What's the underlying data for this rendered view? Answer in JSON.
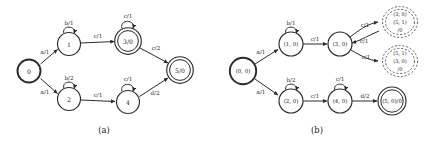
{
  "figure": {
    "background_color": "#ffffff",
    "stroke_color": "#2b2b2b",
    "cloud_stroke_color": "#4a4a4a",
    "panels": [
      {
        "id": "panel-a",
        "caption": "(a)",
        "states": [
          {
            "id": "s0",
            "label": "0",
            "type": "start",
            "cx": 29,
            "cy": 71
          },
          {
            "id": "s1",
            "label": "1",
            "type": "normal",
            "cx": 69,
            "cy": 44
          },
          {
            "id": "s2",
            "label": "2",
            "type": "normal",
            "cx": 69,
            "cy": 99
          },
          {
            "id": "s3",
            "label": "3/0",
            "type": "accept",
            "cx": 128,
            "cy": 41
          },
          {
            "id": "s4",
            "label": "4",
            "type": "normal",
            "cx": 128,
            "cy": 102
          },
          {
            "id": "s5",
            "label": "5/0",
            "type": "accept",
            "cx": 180,
            "cy": 70
          }
        ],
        "transitions": [
          {
            "from": "s0",
            "to": "s1",
            "label": "a/1"
          },
          {
            "from": "s0",
            "to": "s2",
            "label": "a/1"
          },
          {
            "from": "s1",
            "to": "s1",
            "label": "b/1",
            "self_loop": true
          },
          {
            "from": "s2",
            "to": "s2",
            "label": "b/2",
            "self_loop": true
          },
          {
            "from": "s1",
            "to": "s3",
            "label": "c/1"
          },
          {
            "from": "s2",
            "to": "s4",
            "label": "c/1"
          },
          {
            "from": "s3",
            "to": "s3",
            "label": "c/1",
            "self_loop": true
          },
          {
            "from": "s4",
            "to": "s4",
            "label": "c/1",
            "self_loop": true
          },
          {
            "from": "s3",
            "to": "s5",
            "label": "c/2"
          },
          {
            "from": "s4",
            "to": "s5",
            "label": "d/2"
          }
        ]
      },
      {
        "id": "panel-b",
        "caption": "(b)",
        "states": [
          {
            "id": "t0",
            "label": "(0, 0)",
            "type": "start",
            "cx": 243,
            "cy": 71
          },
          {
            "id": "t1",
            "label": "(1, 0)",
            "type": "normal",
            "cx": 291,
            "cy": 44
          },
          {
            "id": "t2",
            "label": "(2, 0)",
            "type": "normal",
            "cx": 291,
            "cy": 101
          },
          {
            "id": "t3",
            "label": "(3, 0)",
            "type": "normal",
            "cx": 340,
            "cy": 44
          },
          {
            "id": "t4",
            "label": "(4, 0)",
            "type": "normal",
            "cx": 340,
            "cy": 101
          },
          {
            "id": "t5",
            "label": "(5, 0)/0",
            "type": "accept",
            "cx": 392,
            "cy": 101
          }
        ],
        "clouds": [
          {
            "id": "cloud-upper",
            "cx": 400,
            "cy": 22,
            "lines": [
              "(3, 0)",
              "(5, 1)",
              "/0"
            ]
          },
          {
            "id": "cloud-lower",
            "cx": 400,
            "cy": 61,
            "lines": [
              "(5, 1)",
              "(3, 0)",
              "/0"
            ]
          }
        ],
        "transitions": [
          {
            "from": "t0",
            "to": "t1",
            "label": "a/1"
          },
          {
            "from": "t0",
            "to": "t2",
            "label": "a/1"
          },
          {
            "from": "t1",
            "to": "t1",
            "label": "b/1",
            "self_loop": true
          },
          {
            "from": "t2",
            "to": "t2",
            "label": "b/2",
            "self_loop": true
          },
          {
            "from": "t1",
            "to": "t3",
            "label": "c/1"
          },
          {
            "from": "t2",
            "to": "t4",
            "label": "c/1"
          },
          {
            "from": "t4",
            "to": "t4",
            "label": "c/1",
            "self_loop": true
          },
          {
            "from": "t4",
            "to": "t5",
            "label": "d/2"
          },
          {
            "from": "t3",
            "to": "cloud-upper",
            "label": "c/1"
          },
          {
            "from": "t3",
            "to": "cloud-lower",
            "label": "c/1"
          },
          {
            "from": "cloud-upper",
            "to": "t3",
            "label": "c/1"
          }
        ]
      }
    ]
  }
}
